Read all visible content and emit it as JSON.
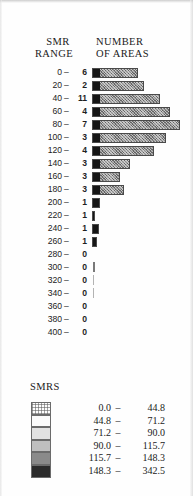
{
  "figure": {
    "headers": {
      "left_line1": "SMR",
      "left_line2": "RANGE",
      "right_line1": "NUMBER",
      "right_line2": "OF AREAS"
    },
    "dash": "–"
  },
  "chart_data": {
    "type": "bar",
    "orientation": "horizontal",
    "title": "",
    "xlabel": "NUMBER OF AREAS",
    "ylabel": "SMR RANGE",
    "grid": false,
    "legend_position": "below",
    "categories": [
      "0",
      "20",
      "40",
      "60",
      "80",
      "100",
      "120",
      "140",
      "160",
      "180",
      "200",
      "220",
      "240",
      "260",
      "280",
      "300",
      "320",
      "340",
      "360",
      "380",
      "400"
    ],
    "category_suffix": "–",
    "values": [
      6,
      2,
      11,
      4,
      7,
      3,
      4,
      3,
      3,
      3,
      1,
      1,
      1,
      1,
      0,
      0,
      0,
      0,
      0,
      0,
      0
    ],
    "bar_pixel_lengths": [
      46,
      52,
      68,
      78,
      88,
      74,
      62,
      38,
      28,
      32,
      8,
      3,
      7,
      5,
      0,
      0,
      0,
      0,
      0,
      0,
      0
    ],
    "stray_marks": [
      {
        "row": 15,
        "style": "solid"
      },
      {
        "row": 16,
        "style": "faint"
      },
      {
        "row": 17,
        "style": "faint"
      }
    ],
    "xlim": [
      0,
      11
    ],
    "ylim": null
  },
  "legend": {
    "title": "SMRS",
    "dash": "–",
    "items": [
      {
        "lo": "0.0",
        "hi": "44.8",
        "color": "#fdfdfd",
        "pattern": "hatch"
      },
      {
        "lo": "44.8",
        "hi": "71.2",
        "color": "#fbfbfb",
        "pattern": "plain"
      },
      {
        "lo": "71.2",
        "hi": "90.0",
        "color": "#e2e2e2",
        "pattern": "plain"
      },
      {
        "lo": "90.0",
        "hi": "115.7",
        "color": "#bfbfbf",
        "pattern": "plain"
      },
      {
        "lo": "115.7",
        "hi": "148.3",
        "color": "#8a8a8a",
        "pattern": "plain"
      },
      {
        "lo": "148.3",
        "hi": "342.5",
        "color": "#2b2b2b",
        "pattern": "plain"
      }
    ]
  }
}
